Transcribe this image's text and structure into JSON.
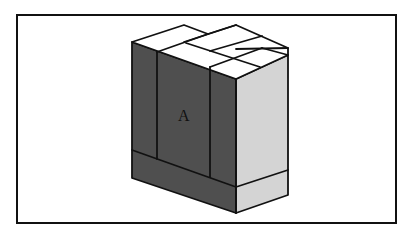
{
  "diagram": {
    "label": "A",
    "colors": {
      "frame": "#111111",
      "top_face": "#ffffff",
      "front_face": "#4f4f4f",
      "side_face": "#d4d4d4",
      "outline": "#111111"
    }
  }
}
